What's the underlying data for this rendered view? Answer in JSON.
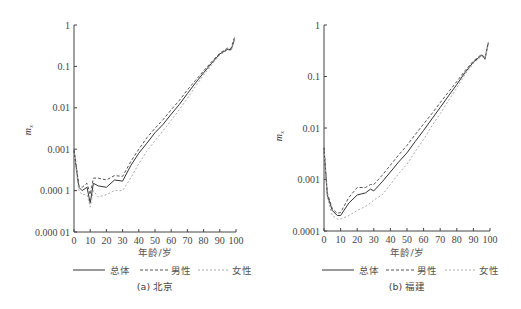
{
  "chart_data": [
    {
      "type": "line",
      "title": "(a) 北京",
      "xlabel": "年龄/岁",
      "ylabel": "m_x",
      "yscale": "log",
      "xlim": [
        0,
        100
      ],
      "ylim": [
        1e-05,
        1
      ],
      "xticks": [
        "0",
        "10",
        "20",
        "30",
        "40",
        "50",
        "60",
        "70",
        "80",
        "90",
        "100"
      ],
      "yticks": [
        "1",
        "0.1",
        "0.01",
        "0.001",
        "0.000 1",
        "0.000 01"
      ],
      "legend": [
        "总体",
        "男性",
        "女性"
      ],
      "legend_position": "bottom",
      "grid": false,
      "x": [
        0,
        3,
        5,
        8,
        10,
        12,
        15,
        20,
        25,
        30,
        35,
        40,
        45,
        50,
        55,
        60,
        65,
        70,
        75,
        80,
        85,
        90,
        95,
        97,
        99
      ],
      "series": [
        {
          "name": "总体",
          "style": "solid",
          "values": [
            0.0009,
            0.00012,
            0.0001,
            0.00012,
            5e-05,
            0.00015,
            0.00013,
            0.00012,
            0.00018,
            0.00017,
            0.0004,
            0.0008,
            0.0014,
            0.0025,
            0.004,
            0.007,
            0.012,
            0.022,
            0.04,
            0.07,
            0.12,
            0.2,
            0.26,
            0.25,
            0.45
          ]
        },
        {
          "name": "男性",
          "style": "dashed",
          "values": [
            0.001,
            0.00013,
            0.00012,
            0.00015,
            8e-05,
            0.0002,
            0.0002,
            0.00018,
            0.00023,
            0.00022,
            0.0005,
            0.001,
            0.0019,
            0.0032,
            0.0052,
            0.009,
            0.015,
            0.027,
            0.046,
            0.078,
            0.13,
            0.21,
            0.28,
            0.27,
            0.5
          ]
        },
        {
          "name": "女性",
          "style": "dotted",
          "values": [
            0.0008,
            0.0001,
            8e-05,
            8e-05,
            4e-05,
            0.0001,
            7e-05,
            8e-05,
            0.0001,
            0.0001,
            0.0002,
            0.00045,
            0.0009,
            0.0016,
            0.0028,
            0.005,
            0.009,
            0.017,
            0.033,
            0.062,
            0.11,
            0.19,
            0.25,
            0.24,
            0.42
          ]
        }
      ]
    },
    {
      "type": "line",
      "title": "(b) 福建",
      "xlabel": "年龄/岁",
      "ylabel": "m_x",
      "yscale": "log",
      "xlim": [
        0,
        100
      ],
      "ylim": [
        0.0001,
        1
      ],
      "xticks": [
        "0",
        "10",
        "20",
        "30",
        "40",
        "50",
        "60",
        "70",
        "80",
        "90",
        "100"
      ],
      "yticks": [
        "1",
        "0.1",
        "0.01",
        "0.001",
        "0.0001"
      ],
      "legend": [
        "总体",
        "男性",
        "女性"
      ],
      "legend_position": "bottom",
      "grid": false,
      "x": [
        0,
        2,
        5,
        8,
        10,
        15,
        20,
        25,
        28,
        30,
        35,
        40,
        45,
        50,
        55,
        60,
        65,
        70,
        75,
        80,
        85,
        90,
        95,
        97,
        99
      ],
      "series": [
        {
          "name": "总体",
          "style": "solid",
          "values": [
            0.004,
            0.0005,
            0.00025,
            0.0002,
            0.0002,
            0.00035,
            0.0005,
            0.00055,
            0.00065,
            0.0006,
            0.0009,
            0.0014,
            0.0022,
            0.0033,
            0.0055,
            0.009,
            0.015,
            0.025,
            0.042,
            0.07,
            0.12,
            0.19,
            0.26,
            0.22,
            0.45
          ]
        },
        {
          "name": "男性",
          "style": "dashed",
          "values": [
            0.0042,
            0.00055,
            0.00027,
            0.00022,
            0.00023,
            0.00045,
            0.0007,
            0.0007,
            0.0008,
            0.0008,
            0.0012,
            0.0019,
            0.003,
            0.0046,
            0.0075,
            0.012,
            0.019,
            0.031,
            0.05,
            0.08,
            0.13,
            0.2,
            0.27,
            0.23,
            0.47
          ]
        },
        {
          "name": "女性",
          "style": "dotted",
          "values": [
            0.0038,
            0.00045,
            0.0002,
            0.00017,
            0.00017,
            0.0002,
            0.00025,
            0.0003,
            0.00035,
            0.0004,
            0.0005,
            0.0008,
            0.0013,
            0.002,
            0.0035,
            0.006,
            0.011,
            0.019,
            0.034,
            0.06,
            0.11,
            0.18,
            0.25,
            0.21,
            0.43
          ]
        }
      ]
    }
  ],
  "charts": [
    {
      "ylabel": "m",
      "ylabel_sub": "x",
      "yticks": [
        "1",
        "0.1",
        "0.01",
        "0.001",
        "0.000 1",
        "0.000 01"
      ],
      "xticks": [
        "0",
        "10",
        "20",
        "30",
        "40",
        "50",
        "60",
        "70",
        "80",
        "90",
        "100"
      ],
      "xlabel": "年龄/岁",
      "legend": {
        "total": "总体",
        "male": "男性",
        "female": "女性"
      },
      "caption": "(a) 北京"
    },
    {
      "ylabel": "m",
      "ylabel_sub": "x",
      "yticks": [
        "1",
        "0.1",
        "0.01",
        "0.001",
        "0.0001"
      ],
      "xticks": [
        "0",
        "10",
        "20",
        "30",
        "40",
        "50",
        "60",
        "70",
        "80",
        "90",
        "100"
      ],
      "xlabel": "年龄/岁",
      "legend": {
        "total": "总体",
        "male": "男性",
        "female": "女性"
      },
      "caption": "(b) 福建"
    }
  ],
  "colors": {
    "axis": "#444444",
    "total": "#333333",
    "male": "#555555",
    "female": "#aaaaaa"
  }
}
